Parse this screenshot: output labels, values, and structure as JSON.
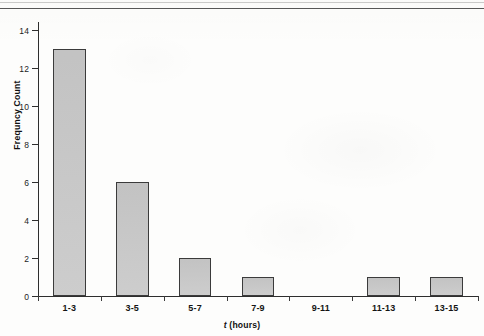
{
  "figure": {
    "background_color": "#fdfdfc",
    "bar_fill_color": "#c9c9c9",
    "bar_edge_color": "#3b3b3b",
    "axis_color": "#2e2e2e",
    "text_color": "#141414"
  },
  "chart_data": {
    "type": "bar",
    "title": "",
    "subtitle": "",
    "categories": [
      "1-3",
      "3-5",
      "5-7",
      "7-9",
      "9-11",
      "11-13",
      "13-15"
    ],
    "values": [
      13,
      6,
      2,
      1,
      0,
      1,
      1
    ],
    "xlabel_prefix": "t",
    "xlabel_suffix": " (hours)",
    "xlabel": "t (hours)",
    "ylabel": "Frequncy Count",
    "ylim": [
      0,
      14
    ],
    "xlim_categories": 7,
    "yticks": [
      0,
      2,
      4,
      6,
      8,
      10,
      12,
      14
    ],
    "ytick_labels": [
      "0",
      "2",
      "4",
      "6",
      "8",
      "10",
      "12",
      "14"
    ],
    "grid": false,
    "legend": null,
    "annotations": []
  }
}
